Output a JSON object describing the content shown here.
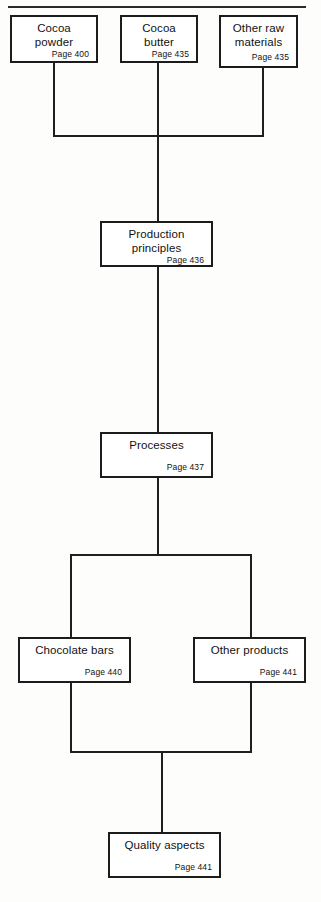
{
  "diagram": {
    "type": "flowchart",
    "page_label_prefix": "Page",
    "colors": {
      "background": "#fdfdfc",
      "box_fill": "#ffffff",
      "box_border": "#1c1c1c",
      "connector": "#1f1f1f",
      "rule": "#2b2b2b",
      "text": "#111111"
    },
    "nodes": [
      {
        "id": "cocoa-powder",
        "label": "Cocoa powder",
        "page": "Page 400"
      },
      {
        "id": "cocoa-butter",
        "label": "Cocoa butter",
        "page": "Page 435"
      },
      {
        "id": "other-raw",
        "label": "Other raw materials",
        "page": "Page 435"
      },
      {
        "id": "production",
        "label": "Production principles",
        "page": "Page 436"
      },
      {
        "id": "processes",
        "label": "Processes",
        "page": "Page 437"
      },
      {
        "id": "chocolate-bars",
        "label": "Chocolate bars",
        "page": "Page 440"
      },
      {
        "id": "other-products",
        "label": "Other products",
        "page": "Page 441"
      },
      {
        "id": "quality",
        "label": "Quality aspects",
        "page": "Page 441"
      }
    ],
    "edges": [
      {
        "from": "cocoa-powder",
        "to": "production"
      },
      {
        "from": "cocoa-butter",
        "to": "production"
      },
      {
        "from": "other-raw",
        "to": "production"
      },
      {
        "from": "production",
        "to": "processes"
      },
      {
        "from": "processes",
        "to": "chocolate-bars"
      },
      {
        "from": "processes",
        "to": "other-products"
      },
      {
        "from": "chocolate-bars",
        "to": "quality"
      },
      {
        "from": "other-products",
        "to": "quality"
      }
    ]
  }
}
